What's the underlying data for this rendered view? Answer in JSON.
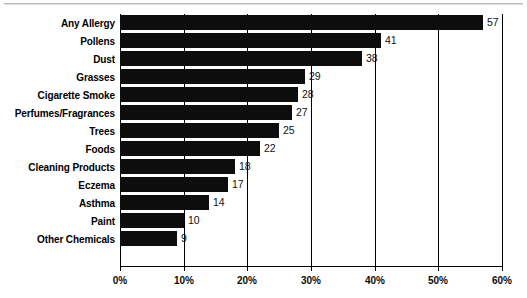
{
  "chart_data": {
    "type": "bar",
    "orientation": "horizontal",
    "title": "",
    "xlabel": "",
    "ylabel": "",
    "xlim": [
      0,
      60
    ],
    "xticks": [
      0,
      10,
      20,
      30,
      40,
      50,
      60
    ],
    "xtick_labels": [
      "0%",
      "10%",
      "20%",
      "30%",
      "40%",
      "50%",
      "60%"
    ],
    "grid": true,
    "grid_axis": "x",
    "legend": false,
    "bar_color": "#0d0d0d",
    "categories": [
      "Any Allergy",
      "Pollens",
      "Dust",
      "Grasses",
      "Cigarette Smoke",
      "Perfumes/Fragrances",
      "Trees",
      "Foods",
      "Cleaning Products",
      "Eczema",
      "Asthma",
      "Paint",
      "Other Chemicals"
    ],
    "values": [
      57,
      41,
      38,
      29,
      28,
      27,
      25,
      22,
      18,
      17,
      14,
      10,
      9
    ],
    "value_labels": [
      "57",
      "41",
      "38",
      "29",
      "28",
      "27",
      "25",
      "22",
      "18",
      "17",
      "14",
      "10",
      "9"
    ]
  }
}
